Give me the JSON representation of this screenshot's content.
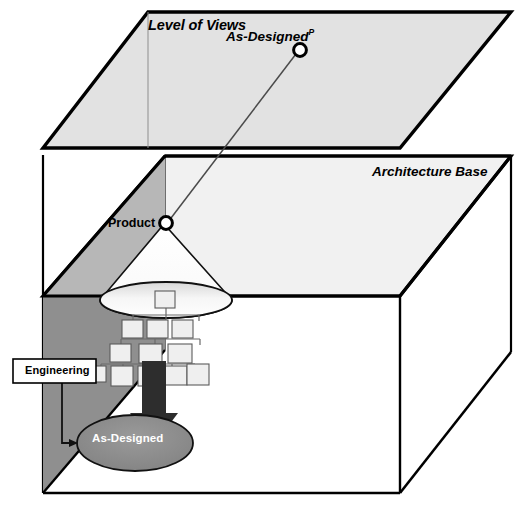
{
  "figure": {
    "type": "diagram",
    "subtype": "3d-layered-architecture",
    "background_color": "#ffffff",
    "width": 515,
    "height": 509
  },
  "planes": {
    "top": {
      "label": "Level of Views",
      "fill": "#e0e0e0",
      "stroke": "#000000"
    },
    "bottom": {
      "label": "Architecture Base",
      "fill": "#f1f1f1",
      "stroke": "#000000"
    },
    "left_face_upper": {
      "fill": "#b5b5b5"
    },
    "left_face_lower": {
      "fill": "#8f8f8f"
    }
  },
  "nodes": {
    "as_designed_view": {
      "label": "As-Designed",
      "superscript": "P",
      "shape": "circle",
      "fill": "#ffffff",
      "stroke": "#000000"
    },
    "product": {
      "label": "Product",
      "shape": "circle",
      "fill": "#ffffff",
      "stroke": "#000000"
    },
    "engineering": {
      "label": "Engineering",
      "shape": "rectangle",
      "fill": "#ffffff",
      "stroke": "#000000"
    },
    "as_designed_source": {
      "label": "As-Designed",
      "shape": "ellipse",
      "fill": "#8a8a8a",
      "stroke": "#000000",
      "text_color": "#ffffff"
    }
  },
  "cone": {
    "name": "projection-cone",
    "fill": "#f7f7f7",
    "stroke": "#000000",
    "base_ellipse_fill": "#ededed"
  },
  "tree": {
    "name": "product-structure-tree",
    "box_fill": "#efefef",
    "box_stroke": "#555555",
    "levels": [
      {
        "level": 1,
        "count": 1
      },
      {
        "level": 2,
        "count": 3
      },
      {
        "level": 3,
        "count": 3
      },
      {
        "level": 4,
        "count": 5
      }
    ]
  },
  "arrow": {
    "name": "bold-up-arrow",
    "fill": "#2b2b2b"
  },
  "connectors": [
    {
      "from": "product",
      "to": "as_designed_view",
      "style": "line"
    },
    {
      "from": "engineering",
      "to": "as_designed_source",
      "style": "elbow-arrow"
    },
    {
      "from": "as_designed_source",
      "to": "tree",
      "style": "block-arrow"
    }
  ]
}
